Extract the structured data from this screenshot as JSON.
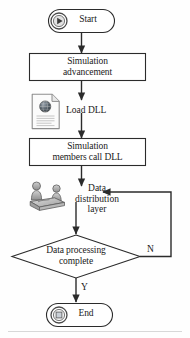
{
  "diagram": {
    "type": "flowchart",
    "background_color": "#fefefe",
    "stroke_color": "#2b2b2b",
    "text_color": "#1a1a1a"
  },
  "nodes": {
    "start": {
      "label": "Start",
      "shape": "rounded-terminator",
      "icon": "play-icon"
    },
    "simulation_advancement": {
      "label": "Simulation\nadvancement",
      "shape": "process-rectangle"
    },
    "load_dll": {
      "label": "Load DLL",
      "shape": "document-icon-label",
      "icon": "document-icon"
    },
    "members_call_dll": {
      "label": "Simulation\nmembers call DLL",
      "shape": "process-rectangle"
    },
    "data_distribution_layer": {
      "label": "Data\ndistribution\nlayer",
      "shape": "people-icon-label",
      "icon": "people-group-icon"
    },
    "decision": {
      "label": "Data processing\ncomplete",
      "shape": "diamond-decision"
    },
    "end": {
      "label": "End",
      "shape": "rounded-terminator",
      "icon": "stop-icon"
    }
  },
  "edges": {
    "yes_label": "Y",
    "no_label": "N"
  }
}
